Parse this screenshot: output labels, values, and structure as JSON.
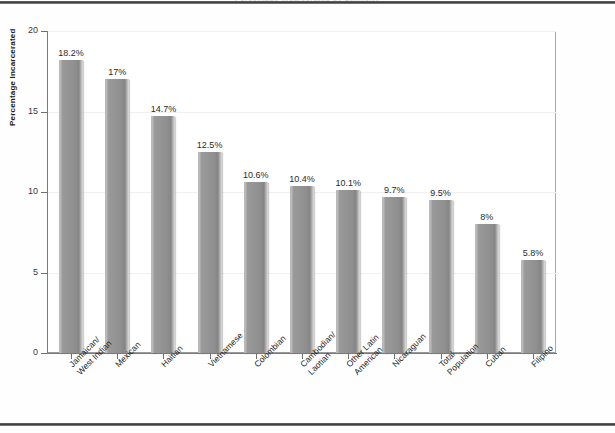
{
  "document": {
    "title_strip": "Percentage Incarcerated by Ethnicity"
  },
  "chart_data": {
    "type": "bar",
    "title": "Percentage Incarcerated by Ethnicity",
    "xlabel": "",
    "ylabel": "Percentage Incarcerated",
    "ylim": [
      0,
      20
    ],
    "ytick_labels": [
      "0",
      "5",
      "10",
      "15",
      "20"
    ],
    "ytick_values": [
      0,
      5,
      10,
      15,
      20
    ],
    "grid": "horizontal-faint",
    "legend": "none",
    "bar_color": "#949494",
    "categories": [
      "Jamaican/ West Indian",
      "Mexican",
      "Haitian",
      "Vietnamese",
      "Colombian",
      "Cambodian/ Laotian",
      "Other Latin American",
      "Nicaraguan",
      "Total Population",
      "Cuban",
      "Filipino"
    ],
    "category_lines": [
      [
        "Jamaican/",
        "West Indian"
      ],
      [
        "Mexican"
      ],
      [
        "Haitian"
      ],
      [
        "Vietnamese"
      ],
      [
        "Colombian"
      ],
      [
        "Cambodian/",
        "Laotian"
      ],
      [
        "Other Latin",
        "American"
      ],
      [
        "Nicaraguan"
      ],
      [
        "Total",
        "Population"
      ],
      [
        "Cuban"
      ],
      [
        "Filipino"
      ]
    ],
    "values": [
      18.2,
      17,
      14.7,
      12.5,
      10.6,
      10.4,
      10.1,
      9.7,
      9.5,
      8,
      5.8
    ],
    "data_labels": [
      "18.2%",
      "17%",
      "14.7%",
      "12.5%",
      "10.6%",
      "10.4%",
      "10.1%",
      "9.7%",
      "9.5%",
      "8%",
      "5.8%"
    ]
  }
}
